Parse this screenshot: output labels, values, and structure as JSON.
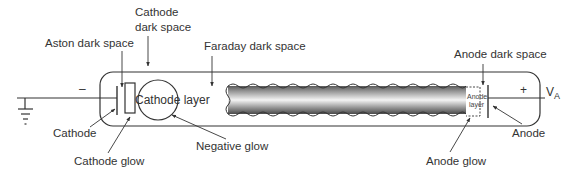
{
  "diagram": {
    "labels": {
      "aston_dark_space": "Aston dark space",
      "cathode_dark_space_line1": "Cathode",
      "cathode_dark_space_line2": "dark space",
      "faraday_dark_space": "Faraday dark space",
      "anode_dark_space": "Anode dark space",
      "cathode": "Cathode",
      "cathode_glow": "Cathode glow",
      "cathode_layer": "Cathode layer",
      "negative_glow": "Negative glow",
      "anode_layer_line1": "Anode",
      "anode_layer_line2": "layer",
      "anode_glow": "Anode glow",
      "anode": "Anode",
      "minus_sign": "–",
      "plus_sign": "+",
      "voltage_symbol": "V",
      "voltage_subscript": "A"
    },
    "colors": {
      "line": "#333333",
      "column_dark": "#555555",
      "column_light": "#f2f2f2",
      "background": "#ffffff"
    }
  }
}
